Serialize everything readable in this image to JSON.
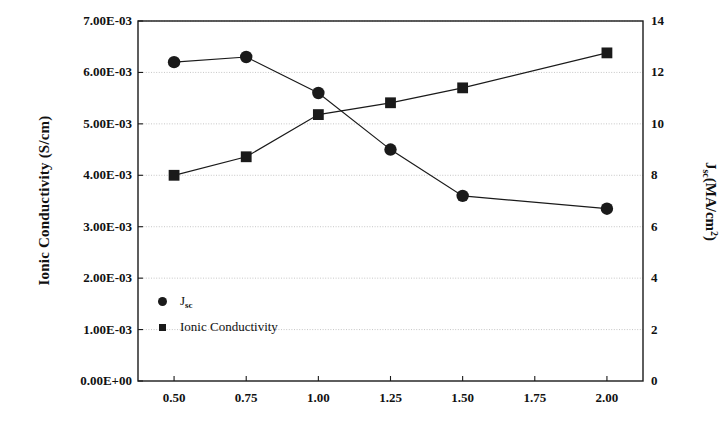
{
  "chart_data": {
    "type": "line",
    "title": "",
    "xlabel": "",
    "ylabel": "Ionic Conductivity (S/cm)",
    "y2label": "J<sub>sc</sub>(MA/cm<sup>2</sup>)",
    "y2label_parts": {
      "main": "J",
      "sub": "sc",
      "rest": "(MA/cm",
      "sup": "2",
      "tail": ")"
    },
    "x": [
      0.5,
      0.75,
      1.0,
      1.25,
      1.5,
      2.0
    ],
    "xlim": [
      0.375,
      2.125
    ],
    "xticks": [
      0.5,
      0.75,
      1.0,
      1.25,
      1.5,
      1.75,
      2.0
    ],
    "xticklabels": [
      "0.50",
      "0.75",
      "1.00",
      "1.25",
      "1.50",
      "1.75",
      "2.00"
    ],
    "ylim": [
      0,
      0.007
    ],
    "yticks": [
      0,
      0.001,
      0.002,
      0.003,
      0.004,
      0.005,
      0.006,
      0.007
    ],
    "yticklabels": [
      "0.00E+00",
      "1.00E-03",
      "2.00E-03",
      "3.00E-03",
      "4.00E-03",
      "5.00E-03",
      "6.00E-03",
      "7.00E-03"
    ],
    "y2lim": [
      0,
      14
    ],
    "y2ticks": [
      0,
      2,
      4,
      6,
      8,
      10,
      12,
      14
    ],
    "y2ticklabels": [
      "0",
      "2",
      "4",
      "6",
      "8",
      "10",
      "12",
      "14"
    ],
    "grid": true,
    "grid_axis": "y",
    "legend_position": "inside-lower-left",
    "series": [
      {
        "name": "J_sc",
        "legend_label_main": "J",
        "legend_label_sub": "sc",
        "marker": "circle",
        "axis": "right",
        "color": "#1a1a1a",
        "values": [
          12.4,
          12.6,
          11.2,
          9.0,
          7.2,
          6.7
        ]
      },
      {
        "name": "Ionic Conductivity",
        "legend_label_main": "Ionic Conductivity",
        "legend_label_sub": "",
        "marker": "square",
        "axis": "left",
        "color": "#1a1a1a",
        "values": [
          0.004,
          0.00436,
          0.00518,
          0.00541,
          0.0057,
          0.00638
        ]
      }
    ]
  },
  "plot_box": {
    "left": 138,
    "right": 643,
    "top": 21,
    "bottom": 381
  },
  "colors": {
    "axis": "#1a1a1a",
    "grid": "#b8b8b8",
    "marker": "#1a1a1a",
    "background": "#ffffff"
  }
}
